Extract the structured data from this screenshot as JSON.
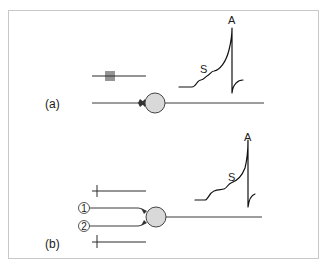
{
  "figure": {
    "colors": {
      "frame": "#c8c8c8",
      "soma_fill": "#d9d9d9",
      "stroke": "#2a2a2a"
    },
    "panels": [
      {
        "id": "a",
        "label": "(a)",
        "description": "Single presynaptic input firing a high-frequency burst onto one neuron (temporal summation)",
        "stimulus": {
          "ticks": 5,
          "pattern": "||||"
        },
        "inputs": [],
        "trace": {
          "summation_label": "S",
          "action_potential_label": "A"
        }
      },
      {
        "id": "b",
        "label": "(b)",
        "description": "Two separate presynaptic inputs each firing one spike onto the same neuron (spatial summation)",
        "stimulus": {
          "ticks_per_line": 1,
          "lines": 2
        },
        "inputs": [
          {
            "number": "1"
          },
          {
            "number": "2"
          }
        ],
        "trace": {
          "summation_label": "S",
          "action_potential_label": "A"
        }
      }
    ]
  }
}
